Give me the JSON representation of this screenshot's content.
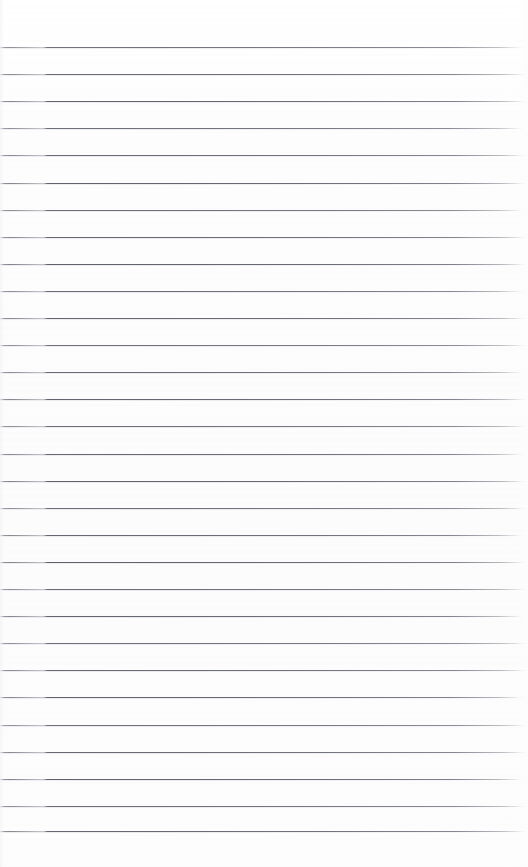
{
  "document": {
    "kind": "lined-paper",
    "title": "",
    "page_text": "",
    "written_content": "",
    "is_blank": true
  },
  "page": {
    "width": 528,
    "height": 867,
    "background_color": "#fdfdfd",
    "paper_tone": "#fcfcfc"
  },
  "rules": {
    "count": 30,
    "line_color": "#5a5c66",
    "line_thickness_px": 1,
    "first_line_y": 47,
    "spacing_px": 27.1,
    "last_line_y": 831,
    "left_start_x": 0,
    "right_end_x": 520,
    "top_margin_px": 47,
    "bottom_margin_px": 36,
    "line_y_positions": [
      47,
      74.1,
      101.2,
      128.3,
      155.4,
      182.5,
      209.6,
      236.7,
      263.8,
      290.9,
      318,
      345.1,
      372.2,
      399.3,
      426.4,
      453.5,
      480.6,
      507.7,
      534.8,
      561.9,
      589,
      616.1,
      643.2,
      670.3,
      697.4,
      724.5,
      751.6,
      778.7,
      805.8,
      831
    ]
  }
}
